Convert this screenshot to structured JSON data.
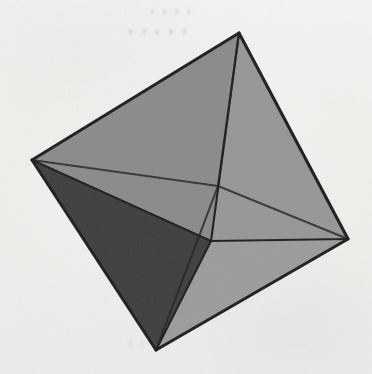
{
  "figure": {
    "medium": "scanned greyscale illustration",
    "background_color": "#f3f1ef",
    "edge_color": "#1f1f1f",
    "edge_width_px": 2.6,
    "canvas": {
      "width": 372,
      "height": 374
    }
  },
  "ghost_text": {
    "top_line_1": "• • • •",
    "top_line_2": "• • • • •",
    "bottom_line": "• • •",
    "right_line": "• •"
  },
  "geometry": {
    "shape": "octahedron",
    "vertex_count": 6,
    "face_count": 8,
    "edge_count": 12,
    "vertices": [
      {
        "name": "top",
        "label": "A",
        "x": 239,
        "y": 33,
        "position": "top apex",
        "hidden": false
      },
      {
        "name": "left",
        "label": "B",
        "x": 32,
        "y": 160,
        "position": "left equatorial",
        "hidden": false
      },
      {
        "name": "right",
        "label": "C",
        "x": 348,
        "y": 239,
        "position": "right equatorial",
        "hidden": false
      },
      {
        "name": "bottom",
        "label": "D",
        "x": 156,
        "y": 350,
        "position": "bottom apex",
        "hidden": false
      },
      {
        "name": "front",
        "label": "E",
        "x": 211,
        "y": 241,
        "position": "near equatorial (front)",
        "hidden": false
      },
      {
        "name": "back",
        "label": "F",
        "x": 218,
        "y": 186,
        "position": "far equatorial (back)",
        "hidden": true
      }
    ],
    "faces": [
      {
        "name": "top-left-front",
        "vertices": [
          "top",
          "left",
          "back"
        ],
        "fill": "#8a8a8a",
        "shading": "medium"
      },
      {
        "name": "top-right-front",
        "vertices": [
          "top",
          "back",
          "right"
        ],
        "fill": "#858585",
        "shading": "medium"
      },
      {
        "name": "top-front-left",
        "vertices": [
          "top",
          "left",
          "front"
        ],
        "fill": "#8a8a8a",
        "shading": "medium"
      },
      {
        "name": "top-front-right",
        "vertices": [
          "top",
          "front",
          "right"
        ],
        "fill": "#969696",
        "shading": "light"
      },
      {
        "name": "bottom-left",
        "vertices": [
          "bottom",
          "left",
          "front"
        ],
        "fill": "#3e3e3e",
        "shading": "dark"
      },
      {
        "name": "bottom-right",
        "vertices": [
          "bottom",
          "front",
          "right"
        ],
        "fill": "#9b9b9b",
        "shading": "light"
      }
    ],
    "edges": [
      {
        "from": "top",
        "to": "left",
        "style": "solid",
        "kind": "silhouette"
      },
      {
        "from": "top",
        "to": "right",
        "style": "solid",
        "kind": "silhouette"
      },
      {
        "from": "bottom",
        "to": "left",
        "style": "solid",
        "kind": "silhouette"
      },
      {
        "from": "bottom",
        "to": "right",
        "style": "solid",
        "kind": "silhouette"
      },
      {
        "from": "top",
        "to": "front",
        "style": "solid",
        "kind": "interior"
      },
      {
        "from": "bottom",
        "to": "front",
        "style": "solid",
        "kind": "interior"
      },
      {
        "from": "left",
        "to": "front",
        "style": "solid",
        "kind": "interior"
      },
      {
        "from": "right",
        "to": "front",
        "style": "solid",
        "kind": "interior"
      },
      {
        "from": "top",
        "to": "back",
        "style": "solid",
        "kind": "interior-far"
      },
      {
        "from": "bottom",
        "to": "back",
        "style": "solid",
        "kind": "interior-far"
      },
      {
        "from": "left",
        "to": "back",
        "style": "solid",
        "kind": "interior-far"
      },
      {
        "from": "right",
        "to": "back",
        "style": "solid",
        "kind": "interior-far"
      }
    ]
  },
  "palette": {
    "background": "#f3f1ef",
    "edge": "#1f1f1f",
    "face_dark": "#3e3e3e",
    "face_medium": "#888888",
    "face_light": "#9b9b9b",
    "ghost_text": "#c9c5c1"
  }
}
